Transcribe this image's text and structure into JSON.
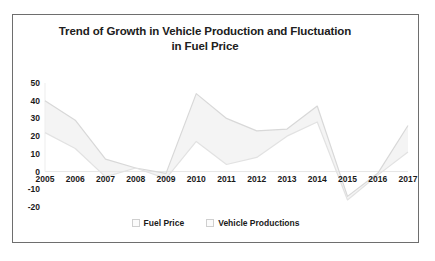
{
  "chart_data": {
    "type": "line",
    "title": "Trend of Growth in Vehicle Production and Fluctuation in Fuel Price",
    "title_line1": "Trend of Growth in Vehicle Production and Fluctuation",
    "title_line2": "in Fuel Price",
    "xlabel": "",
    "ylabel": "",
    "grid": false,
    "legend_position": "bottom",
    "categories": [
      "2005",
      "2006",
      "2007",
      "2008",
      "2009",
      "2010",
      "2011",
      "2012",
      "2013",
      "2014",
      "2015",
      "2016",
      "2017"
    ],
    "ylim": [
      -20,
      50
    ],
    "yticks": [
      50,
      40,
      30,
      20,
      10,
      0,
      -10,
      -20
    ],
    "ytick_labels": [
      "50",
      "40",
      "30",
      "20",
      "10",
      "0",
      "-10",
      "-20"
    ],
    "series": [
      {
        "name": "Fuel Price",
        "color": "#d8d8d8",
        "values": [
          40,
          29,
          7,
          2,
          -1,
          44,
          30,
          23,
          24,
          37,
          -14,
          -1,
          26
        ]
      },
      {
        "name": "Vehicle Productions",
        "color": "#e2e2e2",
        "values": [
          22,
          13,
          -3,
          2,
          -4,
          17,
          4,
          8,
          20,
          28,
          -16,
          -2,
          11
        ]
      }
    ],
    "band_fill": "#f4f4f4"
  },
  "legend": {
    "items": [
      {
        "label": "Fuel Price"
      },
      {
        "label": "Vehicle Productions"
      }
    ]
  },
  "colors": {
    "frame": "#6e6e6e",
    "text": "#1a1a1a",
    "title": "#202020",
    "background": "#ffffff"
  }
}
